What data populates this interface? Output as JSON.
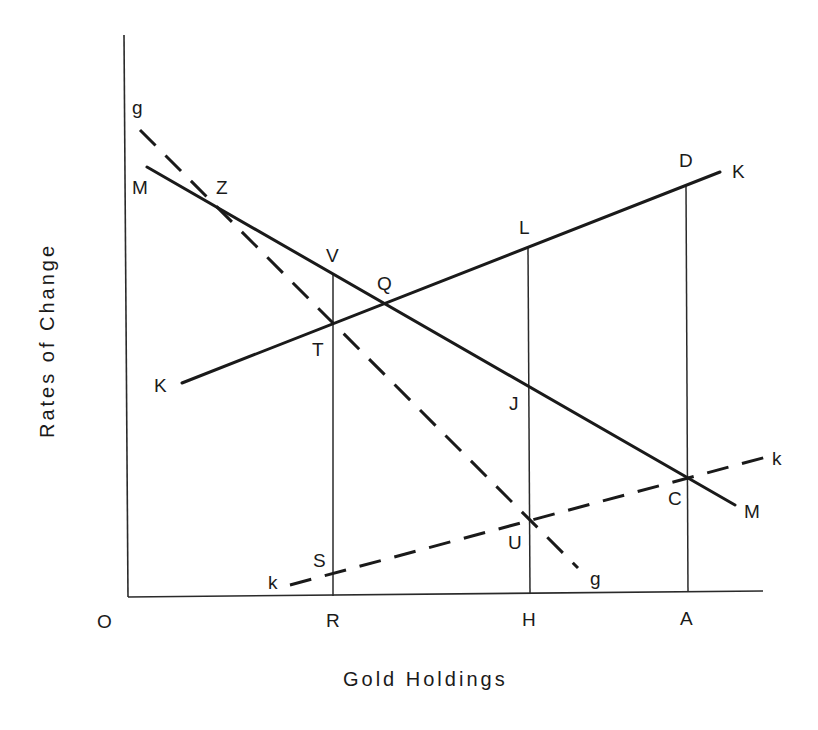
{
  "diagram": {
    "title": "",
    "axes": {
      "x_label": "Gold Holdings",
      "y_label": "Rates of Change",
      "origin_label": "O",
      "x_ticks": [
        "R",
        "H",
        "A"
      ]
    },
    "curves": [
      {
        "id": "MM",
        "style": "solid",
        "start_label": "M",
        "end_label": "M",
        "direction": "downward-sloping"
      },
      {
        "id": "KK",
        "style": "solid",
        "start_label": "K",
        "end_label": "K",
        "direction": "upward-sloping"
      },
      {
        "id": "gg",
        "style": "dashed",
        "start_label": "g",
        "end_label": "g",
        "direction": "downward-sloping"
      },
      {
        "id": "kk",
        "style": "dashed",
        "start_label": "k",
        "end_label": "k",
        "direction": "upward-sloping"
      }
    ],
    "points": {
      "Z": "Z",
      "V": "V",
      "Q": "Q",
      "T": "T",
      "L": "L",
      "D": "D",
      "J": "J",
      "C": "C",
      "U": "U",
      "S": "S"
    },
    "verticals": [
      {
        "at": "R",
        "from": "S",
        "to": "V"
      },
      {
        "at": "H",
        "from": "U",
        "to": "L"
      },
      {
        "at": "A",
        "from": "C",
        "to": "D"
      }
    ]
  }
}
